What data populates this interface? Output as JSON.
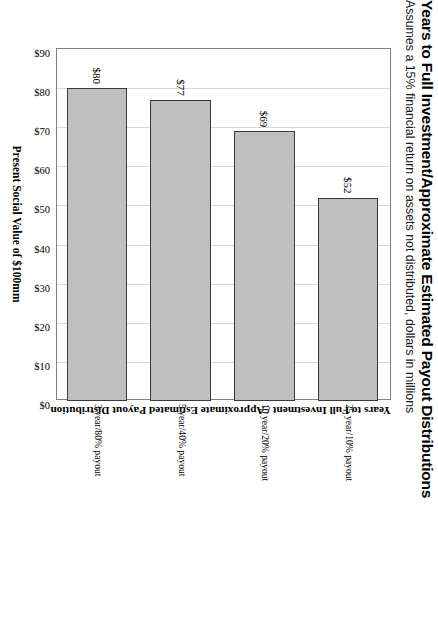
{
  "chart_data": {
    "type": "bar",
    "orientation": "horizontal",
    "title": "Years to Full Investment/Approximate Estimated Payout Distributions",
    "subtitle": "Assumes a 15% financial return on assets not distributed, dollars in millions",
    "xlabel": "Present Social Value of $100mm",
    "ylabel": "Years to Full Investment / Approximate Estimated Payout Distribution",
    "categories": [
      "3 year/80% payout",
      "5 year/40% payout",
      "10 year/20% payout",
      "25 year/10% payout"
    ],
    "values": [
      80,
      77,
      69,
      52
    ],
    "data_labels": [
      "$80",
      "$77",
      "$69",
      "$52"
    ],
    "tick_labels": [
      "$90",
      "$80",
      "$70",
      "$60",
      "$50",
      "$40",
      "$30",
      "$20",
      "$10",
      "$0"
    ],
    "tick_values": [
      90,
      80,
      70,
      60,
      50,
      40,
      30,
      20,
      10,
      0
    ],
    "xlim": [
      0,
      90
    ],
    "axis_direction": "reversed",
    "grid": true,
    "legend": false,
    "bar_fill_color": "#bfbfbf",
    "bar_border_color": "#3a3a3a",
    "plot_border_color": "#7f7f7f",
    "gridline_color": "#d9d9d9"
  }
}
